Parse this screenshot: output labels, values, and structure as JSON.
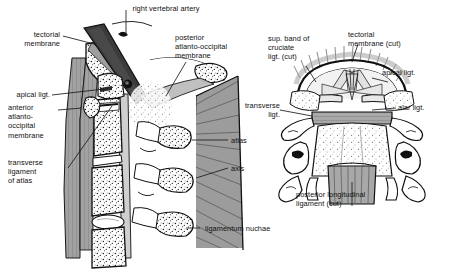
{
  "figure": {
    "background": "#ffffff",
    "ink": "#1a1a1a",
    "tones": {
      "muscle_gray": "#9a9a9a",
      "membrane_gray": "#b5b5b5",
      "artery_dark": "#3b3b3b",
      "bone_white": "#ffffff",
      "stipple": "#222222"
    }
  },
  "panels": [
    {
      "id": "sagittal",
      "name": "median-sagittal-section",
      "caption": "Median sagittal section through craniovertebral junction"
    },
    {
      "id": "posterior",
      "name": "posterior-view",
      "caption": "Posterior view of atlas and axis with cranium removed"
    }
  ],
  "labels": {
    "right_vertebral_artery": "right vertebral artery",
    "tectorial_membrane": "tectorial\nmembrane",
    "apical_ligt": "apical ligt.",
    "anterior_atlanto_occipital_membrane": "anterior\natlanto-\noccipital\nmembrane",
    "transverse_ligament_of_atlas": "transverse\nligament\nof atlas",
    "posterior_atlanto_occipital_membrane": "posterior\natlanto-occipital\nmembrane",
    "atlas": "atlas",
    "axis": "axis",
    "ligamentum_nuchae": "ligamentum nuchae",
    "sup_band_of_cruciate_ligt_cut": "sup. band of\ncruciate\nligt. (cut)",
    "tectorial_membrane_cut": "tectorial\nmembrane (cut)",
    "apical_ligt_right": "apical ligt.",
    "transverse_ligt": "transverse\nligt.",
    "alar_ligt": "alar ligt.",
    "posterior_longitudinal_ligament_cut": "posterior longitudinal\nligament (cut)"
  }
}
